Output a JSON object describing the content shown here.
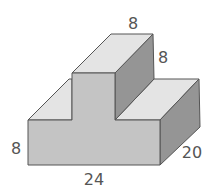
{
  "figure": {
    "type": "3D composite rectangular solid (T-shaped prism)",
    "colors": {
      "front": "#c4c4c4",
      "top": "#e4e4e4",
      "side": "#959595",
      "edge": "#555555",
      "label": "#555555"
    }
  },
  "labels": {
    "top_width": "8",
    "top_height": "8",
    "base_height": "8",
    "base_length": "24",
    "depth": "20"
  }
}
